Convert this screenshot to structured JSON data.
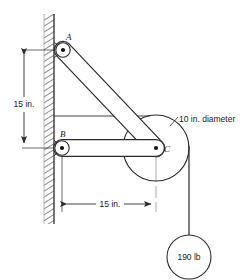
{
  "figure": {
    "colors": {
      "line": "#2b2b2b",
      "wall_hatch": "#6b6b6b",
      "background": "#ffffff",
      "pin_dot": "#111111"
    },
    "joints": [
      {
        "id": "A",
        "label": "A",
        "x": 63,
        "y": 50
      },
      {
        "id": "B",
        "label": "B",
        "x": 62,
        "y": 148
      },
      {
        "id": "C",
        "label": "C",
        "x": 156,
        "y": 148
      }
    ],
    "members": [
      {
        "name": "member-ac",
        "from": "A",
        "to": "C"
      },
      {
        "name": "member-bc",
        "from": "B",
        "to": "C"
      }
    ],
    "pulley": {
      "name": "pulley",
      "center_x": 156,
      "center_y": 148,
      "radius": 33,
      "note": "10 in. diameter"
    },
    "load": {
      "name": "hanging-weight",
      "label": "190 lb",
      "center_x": 189,
      "center_y": 257,
      "radius": 22
    },
    "dimensions": [
      {
        "name": "vertical-dimension",
        "label": "15 in.",
        "orientation": "vertical",
        "from_x": 24,
        "from_y": 50,
        "to_x": 24,
        "to_y": 148
      },
      {
        "name": "horizontal-dimension",
        "label": "15 in.",
        "orientation": "horizontal",
        "from_x": 62,
        "from_y": 204,
        "to_x": 156,
        "to_y": 204
      }
    ],
    "wall": {
      "name": "wall",
      "left": 44,
      "right": 54,
      "top": 14,
      "bottom": 224
    },
    "annotations": [
      {
        "name": "pulley-diameter-note",
        "label": "10 in. diameter",
        "x": 176,
        "y": 122
      }
    ]
  }
}
